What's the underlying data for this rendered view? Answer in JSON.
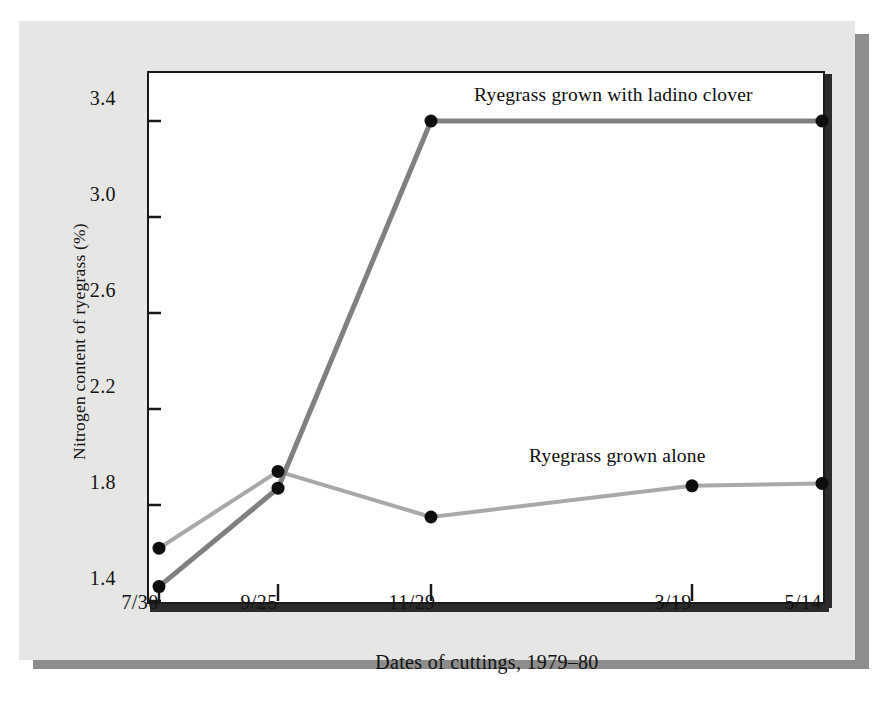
{
  "figure": {
    "background_color": "#e6e6e4",
    "plot_background_color": "#ffffff",
    "frame_color": "#1a1a1a",
    "shadow_color": "#8d8d8d"
  },
  "chart_data": {
    "type": "line",
    "title": "",
    "xlabel": "Dates of cuttings, 1979–80",
    "ylabel": "Nitrogen content of ryegrass (%)",
    "categories": [
      "7/30",
      "9/25",
      "11/29",
      "3/19",
      "5/14"
    ],
    "xtick_labels": [
      "7/30",
      "9/25",
      "11/29",
      "3/19",
      "5/14"
    ],
    "ytick_labels": [
      "1.4",
      "1.8",
      "2.2",
      "2.6",
      "3.0",
      "3.4"
    ],
    "ytick_values": [
      1.4,
      1.8,
      2.2,
      2.6,
      3.0,
      3.4
    ],
    "ylim": [
      1.4,
      3.52
    ],
    "xlim": [
      0,
      4.3
    ],
    "grid": false,
    "legend_position": "inline-annotation",
    "series": [
      {
        "name": "Ryegrass grown with ladino clover",
        "values": [
          1.46,
          1.87,
          3.4,
          3.4,
          3.4
        ],
        "color": "#808080",
        "line_width": 5,
        "marker": "circle",
        "marker_color": "#0d0d0d"
      },
      {
        "name": "Ryegrass grown alone",
        "values": [
          1.62,
          1.94,
          1.75,
          1.88,
          1.89
        ],
        "color": "#a9a9a9",
        "line_width": 4,
        "marker": "circle",
        "marker_color": "#0d0d0d"
      }
    ],
    "annotations": [
      {
        "text": "Ryegrass grown with ladino clover",
        "anchor_series": "Ryegrass grown with ladino clover"
      },
      {
        "text": "Ryegrass grown alone",
        "anchor_series": "Ryegrass grown alone"
      }
    ]
  }
}
